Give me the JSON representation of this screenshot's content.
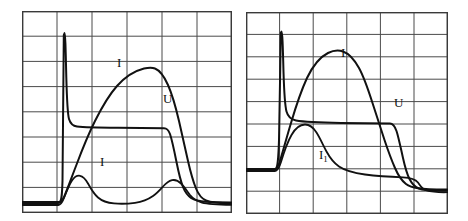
{
  "figure": {
    "title": "",
    "background_color": "#ffffff",
    "trace_color": "#111111",
    "grid_color": "#4a4a4a",
    "frame_color": "#3a3a3a"
  },
  "panels": [
    {
      "id": "left-panel",
      "name": "left-oscillogram",
      "x": 22,
      "y": 11,
      "width": 210,
      "height": 202,
      "grid": {
        "columns": 6,
        "rows": 8,
        "visible": true
      },
      "labels": [
        {
          "name": "label-I-upper",
          "text": "I",
          "sub": "",
          "x": 117,
          "y": 63
        },
        {
          "name": "label-U",
          "text": "U",
          "sub": "",
          "x": 163,
          "y": 100
        },
        {
          "name": "label-I-lower",
          "text": "I",
          "sub": "",
          "x": 100,
          "y": 163
        }
      ],
      "traces": [
        {
          "name": "voltage-trace",
          "label": "U"
        },
        {
          "name": "current-trace-main",
          "label": "I"
        },
        {
          "name": "current-trace-lower",
          "label": "I"
        }
      ]
    },
    {
      "id": "right-panel",
      "name": "right-oscillogram",
      "x": 246,
      "y": 12,
      "width": 202,
      "height": 202,
      "grid": {
        "columns": 6,
        "rows": 9,
        "visible": true
      },
      "labels": [
        {
          "name": "label-I-upper",
          "text": "I",
          "sub": "",
          "x": 345,
          "y": 53
        },
        {
          "name": "label-U",
          "text": "U",
          "sub": "",
          "x": 397,
          "y": 103
        },
        {
          "name": "label-I1-lower",
          "text": "I",
          "sub": "1",
          "x": 325,
          "y": 155
        }
      ],
      "traces": [
        {
          "name": "voltage-trace",
          "label": "U"
        },
        {
          "name": "current-trace-main",
          "label": "I"
        },
        {
          "name": "current-trace-secondary",
          "label": "I1"
        }
      ]
    }
  ],
  "chart_data": {
    "type": "line",
    "title": "",
    "xlabel": "",
    "ylabel": "",
    "grid": true,
    "legend": "inline-annotations",
    "charts": [
      {
        "panel": "left",
        "xlim": [
          0,
          6
        ],
        "ylim": [
          0,
          8
        ],
        "series": [
          {
            "name": "U",
            "label": "U",
            "comment": "Sharp voltage spike at ignition, settling to a flat plateau, then falling to zero.",
            "points": [
              [
                0.0,
                0.4
              ],
              [
                1.1,
                0.4
              ],
              [
                1.16,
                2.3
              ],
              [
                1.2,
                6.95
              ],
              [
                1.24,
                7.1
              ],
              [
                1.28,
                5.2
              ],
              [
                1.34,
                3.9
              ],
              [
                1.42,
                3.45
              ],
              [
                1.55,
                3.32
              ],
              [
                1.8,
                3.28
              ],
              [
                2.5,
                3.26
              ],
              [
                3.4,
                3.25
              ],
              [
                4.05,
                3.25
              ],
              [
                4.18,
                3.2
              ],
              [
                4.28,
                2.8
              ],
              [
                4.38,
                2.05
              ],
              [
                4.48,
                1.3
              ],
              [
                4.6,
                0.8
              ],
              [
                4.75,
                0.55
              ],
              [
                4.95,
                0.44
              ],
              [
                5.3,
                0.41
              ],
              [
                6.0,
                0.4
              ]
            ]
          },
          {
            "name": "I_main",
            "label": "I",
            "comment": "Large smooth current hump rising from baseline, peaking near mid-panel, then decaying.",
            "points": [
              [
                0.0,
                0.38
              ],
              [
                1.05,
                0.38
              ],
              [
                1.15,
                0.45
              ],
              [
                1.3,
                0.85
              ],
              [
                1.6,
                1.55
              ],
              [
                1.9,
                2.25
              ],
              [
                2.2,
                2.95
              ],
              [
                2.5,
                3.6
              ],
              [
                2.8,
                4.2
              ],
              [
                3.1,
                4.68
              ],
              [
                3.4,
                4.95
              ],
              [
                3.65,
                5.02
              ],
              [
                3.9,
                4.92
              ],
              [
                4.15,
                4.55
              ],
              [
                4.35,
                4.05
              ],
              [
                4.52,
                3.4
              ],
              [
                4.68,
                2.6
              ],
              [
                4.82,
                1.8
              ],
              [
                4.95,
                1.15
              ],
              [
                5.1,
                0.72
              ],
              [
                5.3,
                0.5
              ],
              [
                5.55,
                0.42
              ],
              [
                6.0,
                0.4
              ]
            ]
          },
          {
            "name": "I_lower",
            "label": "I",
            "comment": "Low amplitude current trace with an early bump and a second smaller bump before decay.",
            "points": [
              [
                0.0,
                0.33
              ],
              [
                1.08,
                0.33
              ],
              [
                1.18,
                0.45
              ],
              [
                1.32,
                0.85
              ],
              [
                1.45,
                1.15
              ],
              [
                1.58,
                1.28
              ],
              [
                1.7,
                1.22
              ],
              [
                1.85,
                1.0
              ],
              [
                2.05,
                0.75
              ],
              [
                2.3,
                0.58
              ],
              [
                2.6,
                0.5
              ],
              [
                2.95,
                0.48
              ],
              [
                3.3,
                0.52
              ],
              [
                3.6,
                0.65
              ],
              [
                3.85,
                0.88
              ],
              [
                4.05,
                1.05
              ],
              [
                4.22,
                1.1
              ],
              [
                4.38,
                1.0
              ],
              [
                4.55,
                0.78
              ],
              [
                4.72,
                0.56
              ],
              [
                4.9,
                0.42
              ],
              [
                5.15,
                0.35
              ],
              [
                5.5,
                0.33
              ],
              [
                6.0,
                0.33
              ]
            ]
          }
        ]
      },
      {
        "panel": "right",
        "xlim": [
          0,
          6
        ],
        "ylim": [
          0,
          9
        ],
        "series": [
          {
            "name": "U",
            "label": "U",
            "comment": "Sharp voltage spike, long flat plateau, then rapid fall crossing below baseline.",
            "points": [
              [
                0.0,
                1.05
              ],
              [
                0.92,
                1.05
              ],
              [
                0.97,
                3.0
              ],
              [
                1.01,
                7.55
              ],
              [
                1.05,
                7.65
              ],
              [
                1.09,
                5.6
              ],
              [
                1.15,
                4.55
              ],
              [
                1.24,
                4.12
              ],
              [
                1.4,
                4.0
              ],
              [
                1.8,
                3.96
              ],
              [
                2.6,
                3.94
              ],
              [
                3.4,
                3.92
              ],
              [
                3.95,
                3.9
              ],
              [
                4.08,
                3.8
              ],
              [
                4.2,
                3.3
              ],
              [
                4.32,
                2.45
              ],
              [
                4.44,
                1.62
              ],
              [
                4.56,
                1.1
              ],
              [
                4.68,
                0.82
              ],
              [
                4.82,
                0.72
              ],
              [
                5.05,
                0.7
              ],
              [
                5.5,
                0.72
              ],
              [
                6.0,
                0.74
              ]
            ]
          },
          {
            "name": "I_main",
            "label": "I",
            "comment": "Large current hump rising steeply, peaking left of centre, then falling steeply to baseline.",
            "points": [
              [
                0.0,
                1.02
              ],
              [
                0.9,
                1.02
              ],
              [
                1.0,
                1.15
              ],
              [
                1.15,
                1.75
              ],
              [
                1.35,
                2.7
              ],
              [
                1.55,
                3.6
              ],
              [
                1.75,
                4.45
              ],
              [
                1.95,
                5.25
              ],
              [
                2.15,
                5.9
              ],
              [
                2.38,
                6.38
              ],
              [
                2.62,
                6.62
              ],
              [
                2.85,
                6.62
              ],
              [
                3.08,
                6.38
              ],
              [
                3.3,
                5.92
              ],
              [
                3.52,
                5.3
              ],
              [
                3.75,
                4.55
              ],
              [
                3.95,
                3.7
              ],
              [
                4.12,
                2.85
              ],
              [
                4.28,
                2.0
              ],
              [
                4.42,
                1.35
              ],
              [
                4.55,
                0.95
              ],
              [
                4.7,
                0.76
              ],
              [
                4.9,
                0.7
              ],
              [
                5.3,
                0.72
              ],
              [
                6.0,
                0.74
              ]
            ]
          },
          {
            "name": "I_1",
            "label": "I1",
            "comment": "Secondary current with a single early bump that decays smoothly toward baseline.",
            "points": [
              [
                0.0,
                1.0
              ],
              [
                0.93,
                1.0
              ],
              [
                1.02,
                1.2
              ],
              [
                1.15,
                1.85
              ],
              [
                1.3,
                2.45
              ],
              [
                1.45,
                2.82
              ],
              [
                1.6,
                2.95
              ],
              [
                1.75,
                2.88
              ],
              [
                1.92,
                2.58
              ],
              [
                2.12,
                2.18
              ],
              [
                2.35,
                1.78
              ],
              [
                2.6,
                1.48
              ],
              [
                2.9,
                1.25
              ],
              [
                3.25,
                1.1
              ],
              [
                3.65,
                1.0
              ],
              [
                4.05,
                0.94
              ],
              [
                4.45,
                0.9
              ],
              [
                4.8,
                0.86
              ],
              [
                5.05,
                0.72
              ],
              [
                5.4,
                0.68
              ],
              [
                6.0,
                0.7
              ]
            ]
          }
        ]
      }
    ]
  }
}
